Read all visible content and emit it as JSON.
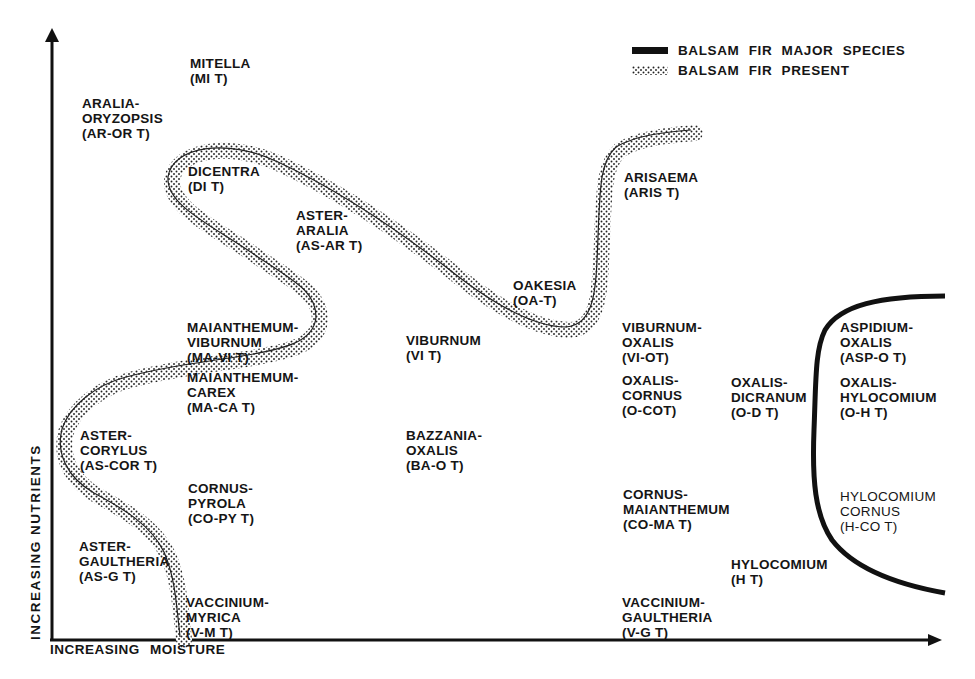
{
  "figure": {
    "y_axis_label": "INCREASING NUTRIENTS",
    "x_axis_label": "INCREASING MOISTURE",
    "legend": [
      {
        "label": "BALSAM FIR MAJOR SPECIES",
        "symbol": "solid-thick-black-line"
      },
      {
        "label": "BALSAM FIR PRESENT",
        "symbol": "stippled-band"
      }
    ],
    "colors": {
      "ink": "#151515",
      "background": "#ffffff"
    }
  },
  "forest_types": [
    {
      "id": "mitella",
      "lines": [
        "MITELLA",
        "(MI T)"
      ]
    },
    {
      "id": "aralia-oryzopsis",
      "lines": [
        "ARALIA-",
        "ORYZOPSIS",
        "(AR-OR T)"
      ]
    },
    {
      "id": "dicentra",
      "lines": [
        "DICENTRA",
        "(DI T)"
      ]
    },
    {
      "id": "aster-aralia",
      "lines": [
        "ASTER-",
        "ARALIA",
        "(AS-AR T)"
      ]
    },
    {
      "id": "arisaema",
      "lines": [
        "ARISAEMA",
        "(ARIS T)"
      ]
    },
    {
      "id": "oakesia",
      "lines": [
        "OAKESIA",
        "(OA-T)"
      ]
    },
    {
      "id": "maianthemum-viburnum",
      "lines": [
        "MAIANTHEMUM-",
        "VIBURNUM",
        "(MA-VI T)"
      ]
    },
    {
      "id": "viburnum",
      "lines": [
        "VIBURNUM",
        "(VI T)"
      ]
    },
    {
      "id": "viburnum-oxalis",
      "lines": [
        "VIBURNUM-",
        "OXALIS",
        "(VI-OT)"
      ]
    },
    {
      "id": "aspidium-oxalis",
      "lines": [
        "ASPIDIUM-",
        "OXALIS",
        "(ASP-O T)"
      ]
    },
    {
      "id": "maianthemum-carex",
      "lines": [
        "MAIANTHEMUM-",
        "CAREX",
        "(MA-CA T)"
      ]
    },
    {
      "id": "oxalis-cornus",
      "lines": [
        "OXALIS-",
        "CORNUS",
        "(O-COT)"
      ]
    },
    {
      "id": "oxalis-dicranum",
      "lines": [
        "OXALIS-",
        "DICRANUM",
        "(O-D T)"
      ]
    },
    {
      "id": "oxalis-hylocomium",
      "lines": [
        "OXALIS-",
        "HYLOCOMIUM",
        "(O-H T)"
      ]
    },
    {
      "id": "aster-corylus",
      "lines": [
        "ASTER-",
        "CORYLUS",
        "(AS-COR T)"
      ]
    },
    {
      "id": "bazzania-oxalis",
      "lines": [
        "BAZZANIA-",
        "OXALIS",
        "(BA-O T)"
      ]
    },
    {
      "id": "cornus-pyrola",
      "lines": [
        "CORNUS-",
        "PYROLA",
        "(CO-PY T)"
      ]
    },
    {
      "id": "cornus-maianthemum",
      "lines": [
        "CORNUS-",
        "MAIANTHEMUM",
        "(CO-MA T)"
      ]
    },
    {
      "id": "hylocomium-cornus",
      "lines": [
        "HYLOCOMIUM",
        "CORNUS",
        "(H-CO T)"
      ]
    },
    {
      "id": "aster-gaultheria",
      "lines": [
        "ASTER-",
        "GAULTHERIA",
        "(AS-G T)"
      ]
    },
    {
      "id": "hylocomium",
      "lines": [
        "HYLOCOMIUM",
        "(H T)"
      ]
    },
    {
      "id": "vaccinium-myrica",
      "lines": [
        "VACCINIUM-",
        "MYRICA",
        "(V-M T)"
      ]
    },
    {
      "id": "vaccinium-gaultheria",
      "lines": [
        "VACCINIUM-",
        "GAULTHERIA",
        "(V-G T)"
      ]
    }
  ]
}
